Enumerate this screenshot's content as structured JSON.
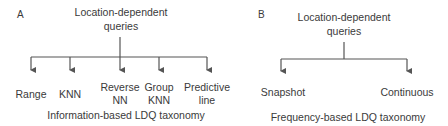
{
  "diagram_a": {
    "panel_label": "A",
    "root_line1": "Location-dependent",
    "root_line2": "queries",
    "children": [
      {
        "line1": "Range",
        "line2": ""
      },
      {
        "line1": "KNN",
        "line2": ""
      },
      {
        "line1": "Reverse",
        "line2": "NN"
      },
      {
        "line1": "Group",
        "line2": "KNN"
      },
      {
        "line1": "Predictive",
        "line2": "line"
      }
    ],
    "caption": "Information-based LDQ taxonomy"
  },
  "diagram_b": {
    "panel_label": "B",
    "root_line1": "Location-dependent",
    "root_line2": "queries",
    "children": [
      {
        "line1": "Snapshot"
      },
      {
        "line1": "Continuous"
      }
    ],
    "caption": "Frequency-based LDQ taxonomy"
  },
  "colors": {
    "line": "#555555",
    "text": "#3a3a3a"
  }
}
